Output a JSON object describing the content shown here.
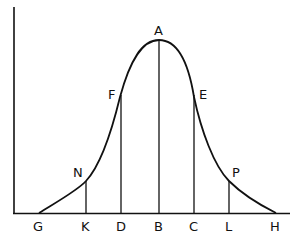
{
  "diagram": {
    "type": "bell-curve-with-ordinates",
    "stroke_color": "#111111",
    "background_color": "#ffffff",
    "peak_label": "A",
    "curve_points": [
      {
        "label": "A",
        "description": "peak"
      },
      {
        "label": "F",
        "description": "left inflection ordinate"
      },
      {
        "label": "E",
        "description": "right inflection ordinate"
      },
      {
        "label": "N",
        "description": "left tail ordinate"
      },
      {
        "label": "P",
        "description": "right tail ordinate"
      }
    ],
    "baseline_labels": [
      "G",
      "K",
      "D",
      "B",
      "C",
      "L",
      "H"
    ],
    "labels": {
      "A": "A",
      "F": "F",
      "E": "E",
      "N": "N",
      "P": "P",
      "G": "G",
      "K": "K",
      "D": "D",
      "B": "B",
      "C": "C",
      "L": "L",
      "H": "H"
    },
    "ordinates": [
      {
        "from": "N",
        "to": "K"
      },
      {
        "from": "F",
        "to": "D"
      },
      {
        "from": "A",
        "to": "B"
      },
      {
        "from": "E",
        "to": "C"
      },
      {
        "from": "P",
        "to": "L"
      }
    ]
  }
}
